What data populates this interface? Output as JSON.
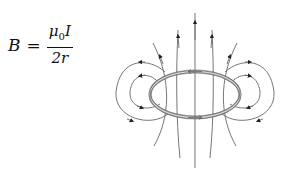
{
  "formula": {
    "lhs": "B",
    "equals": "=",
    "numerator_symbol": "μ",
    "numerator_subscript": "0",
    "numerator_var": "I",
    "denominator": "2r"
  },
  "diagram": {
    "line_color": "#555555",
    "loop_color": "#777777"
  }
}
